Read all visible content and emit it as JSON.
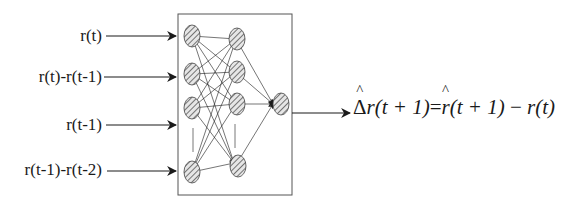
{
  "diagram": {
    "type": "neural-network",
    "inputs": [
      {
        "label": "r(t)",
        "y": 36
      },
      {
        "label": "r(t)-r(t-1)",
        "y": 77
      },
      {
        "label": "r(t-1)",
        "y": 125
      },
      {
        "label": "r(t-1)-r(t-2)",
        "y": 170
      }
    ],
    "layers": {
      "input_nodes": 4,
      "hidden_nodes": 4,
      "output_nodes": 1
    },
    "output": {
      "delta_symbol": "Δ",
      "lhs_var": "r",
      "lhs_arg": "(t + 1)",
      "equals": "=",
      "rhs_var": "r",
      "rhs_arg": "(t + 1)",
      "minus": " − ",
      "rhs2": "r(t)"
    },
    "colors": {
      "stroke": "#1a1a1a",
      "node_fill": "#d8d8d8",
      "box": "#555555"
    }
  }
}
